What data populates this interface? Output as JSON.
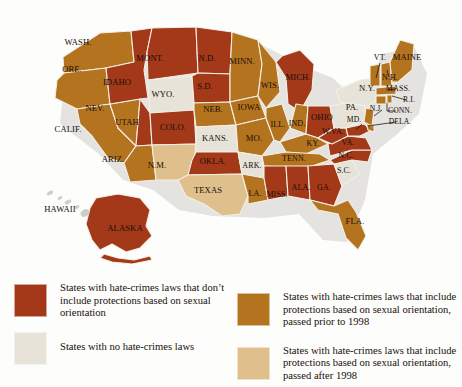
{
  "palette": {
    "no_sexual_orientation": "#a4391a",
    "prior_1998": "#b4731f",
    "no_laws": "#e7e3d8",
    "after_1998": "#dfc08c",
    "hawaii_grey": "#cfcdc7",
    "border": "#f3efe6",
    "label_color": "#140d08",
    "background": "#fdfdfc"
  },
  "legend": {
    "items": [
      {
        "id": "no-sexual-orientation",
        "color_key": "no_sexual_orientation",
        "text": "States with hate-crimes laws that don’t include protections based on sexual orientation"
      },
      {
        "id": "prior-1998",
        "color_key": "prior_1998",
        "text": "States with hate-crimes laws that include protections based on sexual orientation, passed prior to 1998"
      },
      {
        "id": "no-hate-crimes-laws",
        "color_key": "no_laws",
        "text": "States with no hate-crimes laws"
      },
      {
        "id": "after-1998",
        "color_key": "after_1998",
        "text": "States with hate-crimes laws that include protections based on sexual orientation, passed after 1998"
      }
    ]
  },
  "map": {
    "labels": [
      {
        "id": "wash",
        "text": "WASH.",
        "x": 78,
        "y": 45
      },
      {
        "id": "ore",
        "text": "ORE.",
        "x": 72,
        "y": 72
      },
      {
        "id": "idaho",
        "text": "IDAHO",
        "x": 117,
        "y": 85
      },
      {
        "id": "mont",
        "text": "MONT.",
        "x": 150,
        "y": 61
      },
      {
        "id": "nd",
        "text": "N.D.",
        "x": 207,
        "y": 61
      },
      {
        "id": "sd",
        "text": "S.D.",
        "x": 205,
        "y": 89
      },
      {
        "id": "minn",
        "text": "MINN.",
        "x": 242,
        "y": 64
      },
      {
        "id": "wis",
        "text": "WIS.",
        "x": 270,
        "y": 88
      },
      {
        "id": "mich",
        "text": "MICH.",
        "x": 298,
        "y": 80
      },
      {
        "id": "nev",
        "text": "NEV.",
        "x": 95,
        "y": 111
      },
      {
        "id": "utah",
        "text": "UTAH",
        "x": 127,
        "y": 125
      },
      {
        "id": "wyo",
        "text": "WYO.",
        "x": 163,
        "y": 97
      },
      {
        "id": "colo",
        "text": "COLO.",
        "x": 173,
        "y": 130
      },
      {
        "id": "neb",
        "text": "NEB.",
        "x": 213,
        "y": 112
      },
      {
        "id": "iowa",
        "text": "IOWA",
        "x": 249,
        "y": 110
      },
      {
        "id": "ill",
        "text": "ILL.",
        "x": 278,
        "y": 127
      },
      {
        "id": "ind",
        "text": "IND.",
        "x": 297,
        "y": 126
      },
      {
        "id": "ohio",
        "text": "OHIO",
        "x": 322,
        "y": 120
      },
      {
        "id": "calif",
        "text": "CALIF.",
        "x": 68,
        "y": 132
      },
      {
        "id": "ariz",
        "text": "ARIZ.",
        "x": 113,
        "y": 162
      },
      {
        "id": "nm",
        "text": "N.M.",
        "x": 157,
        "y": 168
      },
      {
        "id": "kans",
        "text": "KANS.",
        "x": 215,
        "y": 141
      },
      {
        "id": "mo",
        "text": "MO.",
        "x": 254,
        "y": 141
      },
      {
        "id": "ky",
        "text": "KY.",
        "x": 313,
        "y": 146
      },
      {
        "id": "wva",
        "text": "W.VA.",
        "x": 333,
        "y": 134
      },
      {
        "id": "va",
        "text": "VA.",
        "x": 348,
        "y": 145
      },
      {
        "id": "okla",
        "text": "OKLA.",
        "x": 213,
        "y": 164
      },
      {
        "id": "ark",
        "text": "ARK.",
        "x": 252,
        "y": 168
      },
      {
        "id": "tenn",
        "text": "TENN.",
        "x": 294,
        "y": 161
      },
      {
        "id": "nc",
        "text": "N.C.",
        "x": 346,
        "y": 158
      },
      {
        "id": "sc",
        "text": "S.C.",
        "x": 344,
        "y": 173
      },
      {
        "id": "texas",
        "text": "TEXAS",
        "x": 208,
        "y": 193
      },
      {
        "id": "la",
        "text": "LA.",
        "x": 255,
        "y": 196
      },
      {
        "id": "miss",
        "text": "MISS.",
        "x": 277,
        "y": 197
      },
      {
        "id": "ala",
        "text": "ALA.",
        "x": 301,
        "y": 190
      },
      {
        "id": "ga",
        "text": "GA.",
        "x": 324,
        "y": 190
      },
      {
        "id": "fla",
        "text": "FLA.",
        "x": 355,
        "y": 224
      },
      {
        "id": "vt",
        "text": "VT.",
        "x": 380,
        "y": 60
      },
      {
        "id": "maine",
        "text": "MAINE",
        "x": 407,
        "y": 60
      },
      {
        "id": "nh",
        "text": "N.H.",
        "x": 390,
        "y": 80
      },
      {
        "id": "ny",
        "text": "N.Y.",
        "x": 367,
        "y": 91
      },
      {
        "id": "mass",
        "text": "MASS.",
        "x": 398,
        "y": 91
      },
      {
        "id": "ri",
        "text": "R.I.",
        "x": 409,
        "y": 102
      },
      {
        "id": "pa",
        "text": "PA.",
        "x": 352,
        "y": 110
      },
      {
        "id": "nj",
        "text": "N.J.",
        "x": 376,
        "y": 111
      },
      {
        "id": "conn",
        "text": "CONN.",
        "x": 400,
        "y": 113
      },
      {
        "id": "md",
        "text": "MD.",
        "x": 354,
        "y": 122
      },
      {
        "id": "dela",
        "text": "DELA.",
        "x": 400,
        "y": 124
      },
      {
        "id": "hawaii",
        "text": "HAWAII",
        "x": 60,
        "y": 212
      },
      {
        "id": "alaska",
        "text": "ALASKA",
        "x": 125,
        "y": 231
      }
    ],
    "states": [
      {
        "id": "wa",
        "name": "Washington",
        "category": "prior_1998"
      },
      {
        "id": "or",
        "name": "Oregon",
        "category": "prior_1998"
      },
      {
        "id": "ca",
        "name": "California",
        "category": "prior_1998"
      },
      {
        "id": "nv",
        "name": "Nevada",
        "category": "prior_1998"
      },
      {
        "id": "id",
        "name": "Idaho",
        "category": "no_sexual_orientation"
      },
      {
        "id": "mt",
        "name": "Montana",
        "category": "no_sexual_orientation"
      },
      {
        "id": "wy",
        "name": "Wyoming",
        "category": "no_laws"
      },
      {
        "id": "ut",
        "name": "Utah",
        "category": "no_sexual_orientation"
      },
      {
        "id": "az",
        "name": "Arizona",
        "category": "prior_1998"
      },
      {
        "id": "co",
        "name": "Colorado",
        "category": "no_sexual_orientation"
      },
      {
        "id": "nm",
        "name": "New Mexico",
        "category": "after_1998"
      },
      {
        "id": "nd",
        "name": "North Dakota",
        "category": "no_sexual_orientation"
      },
      {
        "id": "sd",
        "name": "South Dakota",
        "category": "no_sexual_orientation"
      },
      {
        "id": "ne",
        "name": "Nebraska",
        "category": "prior_1998"
      },
      {
        "id": "ks",
        "name": "Kansas",
        "category": "no_sexual_orientation"
      },
      {
        "id": "ok",
        "name": "Oklahoma",
        "category": "no_sexual_orientation"
      },
      {
        "id": "tx",
        "name": "Texas",
        "category": "after_1998"
      },
      {
        "id": "mn",
        "name": "Minnesota",
        "category": "prior_1998"
      },
      {
        "id": "ia",
        "name": "Iowa",
        "category": "prior_1998"
      },
      {
        "id": "mo",
        "name": "Missouri",
        "category": "prior_1998"
      },
      {
        "id": "ar",
        "name": "Arkansas",
        "category": "no_laws"
      },
      {
        "id": "la",
        "name": "Louisiana",
        "category": "prior_1998"
      },
      {
        "id": "wi",
        "name": "Wisconsin",
        "category": "prior_1998"
      },
      {
        "id": "il",
        "name": "Illinois",
        "category": "prior_1998"
      },
      {
        "id": "mi",
        "name": "Michigan",
        "category": "no_sexual_orientation"
      },
      {
        "id": "in",
        "name": "Indiana",
        "category": "prior_1998"
      },
      {
        "id": "oh",
        "name": "Ohio",
        "category": "no_sexual_orientation"
      },
      {
        "id": "ky",
        "name": "Kentucky",
        "category": "prior_1998"
      },
      {
        "id": "tn",
        "name": "Tennessee",
        "category": "prior_1998"
      },
      {
        "id": "ms",
        "name": "Mississippi",
        "category": "no_sexual_orientation"
      },
      {
        "id": "al",
        "name": "Alabama",
        "category": "no_sexual_orientation"
      },
      {
        "id": "ga",
        "name": "Georgia",
        "category": "no_sexual_orientation"
      },
      {
        "id": "fl",
        "name": "Florida",
        "category": "prior_1998"
      },
      {
        "id": "sc",
        "name": "South Carolina",
        "category": "no_laws"
      },
      {
        "id": "nc",
        "name": "North Carolina",
        "category": "no_sexual_orientation"
      },
      {
        "id": "va",
        "name": "Virginia",
        "category": "no_sexual_orientation"
      },
      {
        "id": "wv",
        "name": "West Virginia",
        "category": "no_sexual_orientation"
      },
      {
        "id": "md",
        "name": "Maryland",
        "category": "no_sexual_orientation"
      },
      {
        "id": "de",
        "name": "Delaware",
        "category": "prior_1998"
      },
      {
        "id": "pa",
        "name": "Pennsylvania",
        "category": "no_laws"
      },
      {
        "id": "nj",
        "name": "New Jersey",
        "category": "prior_1998"
      },
      {
        "id": "ny",
        "name": "New York",
        "category": "no_laws"
      },
      {
        "id": "ct",
        "name": "Connecticut",
        "category": "prior_1998"
      },
      {
        "id": "ri",
        "name": "Rhode Island",
        "category": "prior_1998"
      },
      {
        "id": "ma",
        "name": "Massachusetts",
        "category": "prior_1998"
      },
      {
        "id": "vt",
        "name": "Vermont",
        "category": "prior_1998"
      },
      {
        "id": "nh",
        "name": "New Hampshire",
        "category": "prior_1998"
      },
      {
        "id": "me",
        "name": "Maine",
        "category": "prior_1998"
      },
      {
        "id": "ak",
        "name": "Alaska",
        "category": "no_sexual_orientation"
      },
      {
        "id": "hi",
        "name": "Hawaii",
        "category": "hawaii_grey"
      }
    ]
  }
}
